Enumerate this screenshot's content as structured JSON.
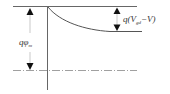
{
  "diagram": {
    "type": "energy-band-diagram",
    "labels": {
      "left_q": "qφ",
      "left_sub": "m",
      "right_prefix": "q(V",
      "right_sub": "gd",
      "right_suffix": "−V)"
    },
    "colors": {
      "line": "#555555",
      "arrow": "#111111",
      "dashdot": "#777777"
    }
  }
}
